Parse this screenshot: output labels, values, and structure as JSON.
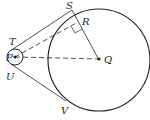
{
  "diagram": {
    "labels": {
      "S": "S",
      "R": "R",
      "T": "T",
      "P": "P",
      "Q": "Q",
      "U": "U",
      "V": "V"
    },
    "colors": {
      "stroke": "#222222",
      "background": "#ffffff"
    }
  }
}
